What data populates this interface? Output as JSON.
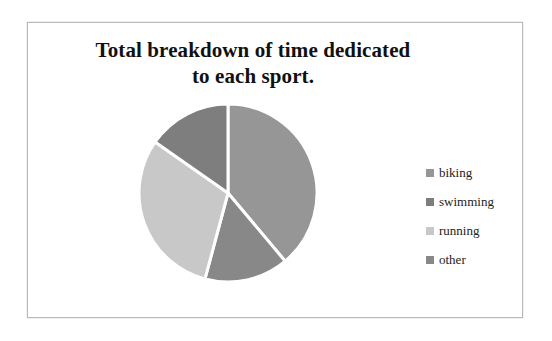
{
  "frame": {
    "border_color": "#b9b9b9",
    "background": "#ffffff"
  },
  "title": {
    "text": "Total breakdown of time dedicated to each sport."
  },
  "legend": {
    "position": "right",
    "items": [
      {
        "label": "biking",
        "color": "#969696",
        "swatch_icon": "legend-swatch-icon"
      },
      {
        "label": "swimming",
        "color": "#7e7e7e",
        "swatch_icon": "legend-swatch-icon"
      },
      {
        "label": "running",
        "color": "#c8c8c8",
        "swatch_icon": "legend-swatch-icon"
      },
      {
        "label": "other",
        "color": "#888888",
        "swatch_icon": "legend-swatch-icon"
      }
    ]
  },
  "chart_data": {
    "type": "pie",
    "title": "Total breakdown of time dedicated to each sport.",
    "xlabel": "",
    "ylabel": "",
    "legend_position": "right",
    "grid": false,
    "start_angle_deg": 0,
    "direction": "clockwise",
    "gap_color": "#ffffff",
    "categories": [
      "biking",
      "swimming",
      "running",
      "other"
    ],
    "values": [
      39,
      15,
      31,
      15
    ],
    "angles_deg": [
      140,
      55,
      110,
      55
    ],
    "colors": [
      "#969696",
      "#7e7e7e",
      "#c8c8c8",
      "#888888"
    ],
    "slices": [
      {
        "label": "biking",
        "value": 39,
        "angle_deg": 140,
        "color": "#969696",
        "start_deg": 0,
        "end_deg": 140
      },
      {
        "label": "other",
        "value": 15,
        "angle_deg": 55,
        "color": "#888888",
        "start_deg": 140,
        "end_deg": 195
      },
      {
        "label": "running",
        "value": 31,
        "angle_deg": 110,
        "color": "#c8c8c8",
        "start_deg": 195,
        "end_deg": 305
      },
      {
        "label": "swimming",
        "value": 15,
        "angle_deg": 55,
        "color": "#7e7e7e",
        "start_deg": 305,
        "end_deg": 360
      }
    ]
  }
}
